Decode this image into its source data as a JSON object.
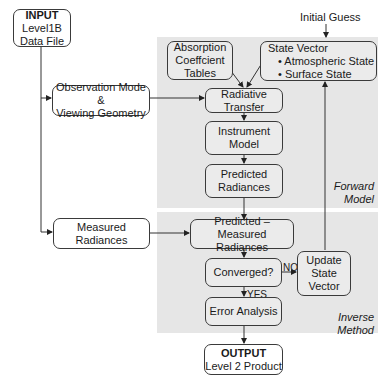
{
  "diagram": {
    "input": {
      "title": "INPUT",
      "line1": "Level1B",
      "line2": "Data File"
    },
    "initial_guess": "Initial Guess",
    "absorption": {
      "line1": "Absorption",
      "line2": "Coeffcient",
      "line3": "Tables"
    },
    "state_vector": {
      "title": "State Vector",
      "item1": "• Atmospheric State",
      "item2": "• Surface State"
    },
    "observation": {
      "line1": "Observation Mode &",
      "line2": "Viewing Geometry"
    },
    "radiative": {
      "line1": "Radiative",
      "line2": "Transfer"
    },
    "instrument": {
      "line1": "Instrument",
      "line2": "Model"
    },
    "predicted": {
      "line1": "Predicted",
      "line2": "Radiances"
    },
    "forward_label": {
      "line1": "Forward",
      "line2": "Model"
    },
    "measured": {
      "line1": "Measured",
      "line2": "Radiances"
    },
    "pred_meas": {
      "line1": "Predicted – Measured",
      "line2": "Radiances"
    },
    "converged": "Converged?",
    "no_label": "NO",
    "yes_label": "YES",
    "update": {
      "line1": "Update",
      "line2": "State",
      "line3": "Vector"
    },
    "error": "Error Analysis",
    "inverse_label": {
      "line1": "Inverse",
      "line2": "Method"
    },
    "output": {
      "title": "OUTPUT",
      "line1": "Level 2 Product"
    }
  }
}
